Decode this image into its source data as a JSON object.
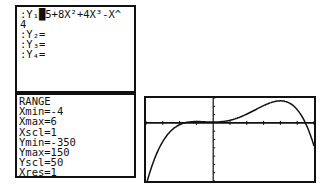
{
  "y_editor": {
    "lines": [
      ":Y₁█5+8X²+4X³-X^",
      "4",
      ":Y₂=",
      ":Y₃=",
      ":Y₄="
    ]
  },
  "range": {
    "title": "RANGE",
    "lines": [
      "Xmin=-4",
      "Xmax=6",
      "Xscl=1",
      "Ymin=-350",
      "Ymax=150",
      "Yscl=50",
      "Xres=1"
    ]
  },
  "graph": {
    "function": "5+8X^2+4X^3-X^4",
    "xmin": -4,
    "xmax": 6,
    "xscl": 1,
    "ymin": -350,
    "ymax": 150,
    "yscl": 50,
    "color": "#111111"
  }
}
